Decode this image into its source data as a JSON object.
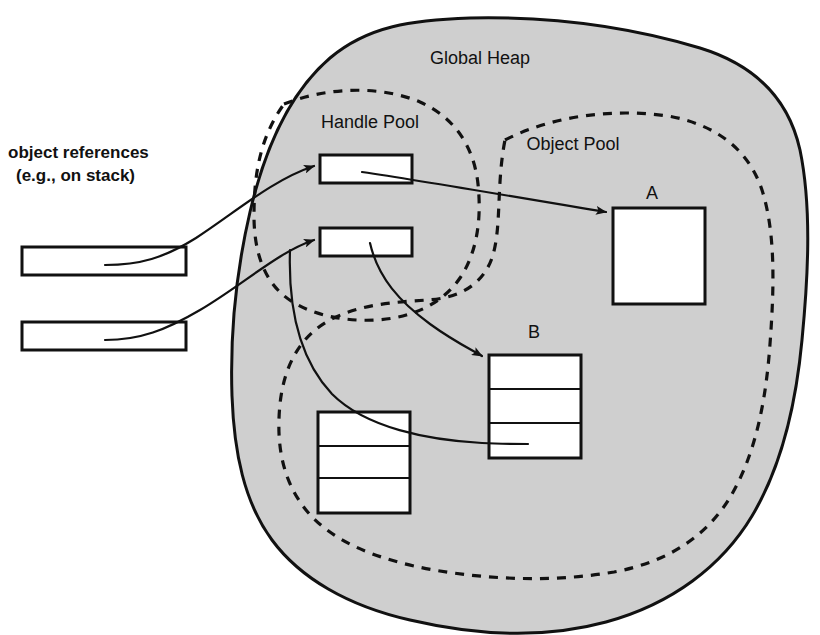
{
  "diagram": {
    "colors": {
      "heap_fill": "#cfcfcf",
      "stroke": "#111111",
      "box_fill": "#ffffff",
      "background": "#ffffff"
    },
    "regions": [
      {
        "id": "global-heap",
        "label": "Global Heap",
        "border": "solid",
        "fill": "#cfcfcf"
      },
      {
        "id": "handle-pool",
        "label": "Handle Pool",
        "border": "dashed",
        "fill": "none"
      },
      {
        "id": "object-pool",
        "label": "Object Pool",
        "border": "dashed",
        "fill": "none"
      }
    ],
    "stack_caption": {
      "line1": "object references",
      "line2": "(e.g., on stack)"
    },
    "stack_slots": [
      {
        "id": "stack-slot-1",
        "label": ""
      },
      {
        "id": "stack-slot-2",
        "label": ""
      }
    ],
    "handles": [
      {
        "id": "handle-1",
        "label": "",
        "points_to": "A"
      },
      {
        "id": "handle-2",
        "label": "",
        "points_to": "B"
      }
    ],
    "objects": [
      {
        "id": "object-a",
        "label": "A",
        "rows": 1
      },
      {
        "id": "object-b",
        "label": "B",
        "rows": 3
      },
      {
        "id": "object-unlabeled",
        "label": "",
        "rows": 3
      }
    ],
    "edges": [
      {
        "from": "stack-slot-1",
        "to": "handle-1",
        "arrow": true
      },
      {
        "from": "stack-slot-2",
        "to": "handle-2",
        "arrow": true
      },
      {
        "from": "handle-1",
        "to": "object-a",
        "arrow": true
      },
      {
        "from": "handle-2",
        "to": "object-b",
        "arrow": true
      },
      {
        "from": "stack-slot-2",
        "to": "object-b-row2",
        "arrow": false
      }
    ]
  }
}
